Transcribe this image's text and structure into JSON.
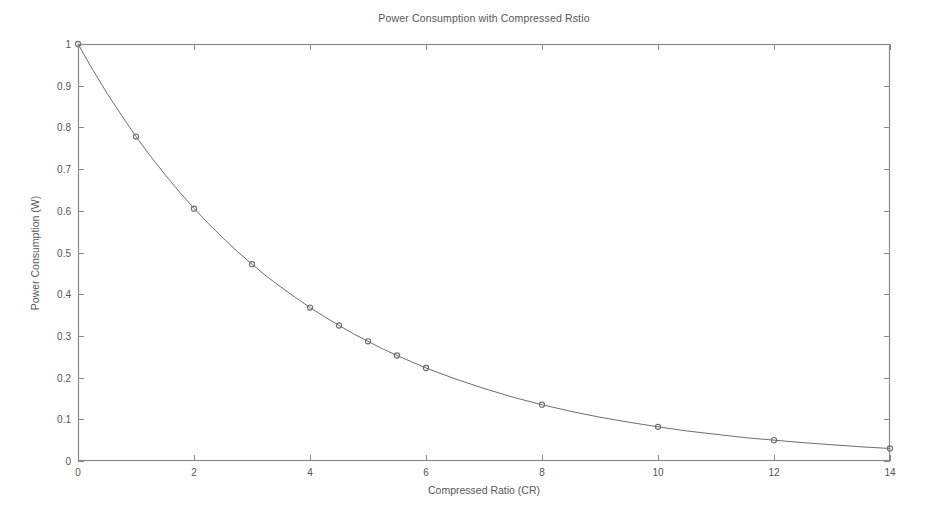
{
  "chart_data": {
    "type": "line",
    "title": "Power Consumption with Compressed Rstio",
    "xlabel": "Compressed Ratio (CR)",
    "ylabel": "Power Consumption (W)",
    "xlim": [
      0,
      14
    ],
    "ylim": [
      0,
      1
    ],
    "grid": false,
    "legend": null,
    "xticks": [
      0,
      2,
      4,
      6,
      8,
      10,
      12,
      14
    ],
    "xtick_labels": [
      "0",
      "2",
      "4",
      "6",
      "8",
      "10",
      "12",
      "14"
    ],
    "yticks": [
      0,
      0.1,
      0.2,
      0.3,
      0.4,
      0.5,
      0.6,
      0.7,
      0.8,
      0.9,
      1
    ],
    "ytick_labels": [
      "0",
      "0.1",
      "0.2",
      "0.3",
      "0.4",
      "0.5",
      "0.6",
      "0.7",
      "0.8",
      "0.9",
      "1"
    ],
    "series": [
      {
        "name": "Power Consumption",
        "marker": "circle-open",
        "line_color": "#6e6e70",
        "marker_color": "#6e6e70",
        "x": [
          0,
          1,
          2,
          3,
          4,
          4.5,
          5,
          5.5,
          6,
          8,
          10,
          12,
          14
        ],
        "values": [
          1.0,
          0.778,
          0.605,
          0.472,
          0.368,
          0.325,
          0.287,
          0.253,
          0.223,
          0.135,
          0.082,
          0.05,
          0.03
        ]
      }
    ],
    "curve_formula_points": {
      "x": [
        0,
        0.25,
        0.5,
        0.75,
        1,
        1.25,
        1.5,
        1.75,
        2,
        2.25,
        2.5,
        2.75,
        3,
        3.25,
        3.5,
        3.75,
        4,
        4.25,
        4.5,
        4.75,
        5,
        5.25,
        5.5,
        5.75,
        6,
        6.5,
        7,
        7.5,
        8,
        8.5,
        9,
        9.5,
        10,
        10.5,
        11,
        11.5,
        12,
        12.5,
        13,
        13.5,
        14
      ],
      "y": [
        1.0,
        0.939,
        0.882,
        0.829,
        0.778,
        0.731,
        0.687,
        0.645,
        0.606,
        0.569,
        0.535,
        0.502,
        0.472,
        0.443,
        0.417,
        0.392,
        0.368,
        0.346,
        0.325,
        0.305,
        0.287,
        0.269,
        0.253,
        0.238,
        0.223,
        0.197,
        0.174,
        0.153,
        0.135,
        0.119,
        0.105,
        0.093,
        0.082,
        0.072,
        0.064,
        0.056,
        0.05,
        0.044,
        0.039,
        0.034,
        0.03
      ]
    }
  },
  "axes": {
    "box_color": "#8a8a8c",
    "tick_direction": "in"
  }
}
